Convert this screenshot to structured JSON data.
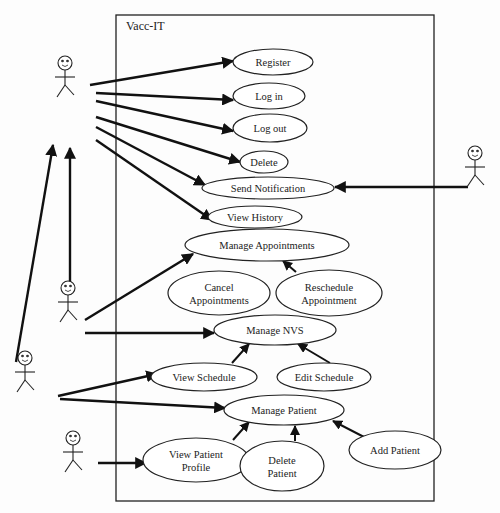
{
  "diagram": {
    "type": "uml-use-case",
    "system_boundary": {
      "title": "Vacc-IT",
      "x": 116,
      "y": 15,
      "w": 318,
      "h": 486
    },
    "actors": [
      {
        "id": "actor1",
        "x": 65,
        "y": 75
      },
      {
        "id": "actor2",
        "x": 68,
        "y": 300
      },
      {
        "id": "actor3",
        "x": 25,
        "y": 370
      },
      {
        "id": "actor4",
        "x": 73,
        "y": 450
      },
      {
        "id": "actor5",
        "x": 475,
        "y": 165
      }
    ],
    "use_cases": [
      {
        "id": "register",
        "label": [
          "Register"
        ],
        "cx": 273,
        "cy": 62,
        "rx": 40,
        "ry": 13
      },
      {
        "id": "login",
        "label": [
          "Log in"
        ],
        "cx": 269,
        "cy": 96,
        "rx": 36,
        "ry": 13
      },
      {
        "id": "logout",
        "label": [
          "Log out"
        ],
        "cx": 270,
        "cy": 128,
        "rx": 37,
        "ry": 14
      },
      {
        "id": "delete",
        "label": [
          "Delete"
        ],
        "cx": 264,
        "cy": 162,
        "rx": 24,
        "ry": 11
      },
      {
        "id": "send_notification",
        "label": [
          "Send Notification"
        ],
        "cx": 268,
        "cy": 188,
        "rx": 66,
        "ry": 11
      },
      {
        "id": "view_history",
        "label": [
          "View History"
        ],
        "cx": 255,
        "cy": 217,
        "rx": 47,
        "ry": 11
      },
      {
        "id": "manage_appointments",
        "label": [
          "Manage Appointments"
        ],
        "cx": 267,
        "cy": 245,
        "rx": 82,
        "ry": 16
      },
      {
        "id": "cancel_appointments",
        "label": [
          "Cancel",
          "Appointments"
        ],
        "cx": 219,
        "cy": 293,
        "rx": 51,
        "ry": 22
      },
      {
        "id": "reschedule_appointment",
        "label": [
          "Reschedule",
          "Appointment"
        ],
        "cx": 329,
        "cy": 293,
        "rx": 53,
        "ry": 23
      },
      {
        "id": "manage_nvs",
        "label": [
          "Manage NVS"
        ],
        "cx": 275,
        "cy": 330,
        "rx": 61,
        "ry": 15
      },
      {
        "id": "view_schedule",
        "label": [
          "View Schedule"
        ],
        "cx": 204,
        "cy": 377,
        "rx": 53,
        "ry": 14
      },
      {
        "id": "edit_schedule",
        "label": [
          "Edit Schedule"
        ],
        "cx": 324,
        "cy": 377,
        "rx": 47,
        "ry": 14
      },
      {
        "id": "manage_patient",
        "label": [
          "Manage Patient"
        ],
        "cx": 284,
        "cy": 410,
        "rx": 60,
        "ry": 15
      },
      {
        "id": "view_patient_profile",
        "label": [
          "View   Patient",
          "Profile"
        ],
        "cx": 196,
        "cy": 460,
        "rx": 53,
        "ry": 22
      },
      {
        "id": "delete_patient",
        "label": [
          "Delete",
          "Patient"
        ],
        "cx": 282,
        "cy": 466,
        "rx": 42,
        "ry": 25
      },
      {
        "id": "add_patient",
        "label": [
          "Add Patient"
        ],
        "cx": 395,
        "cy": 450,
        "rx": 46,
        "ry": 19
      }
    ],
    "associations": [
      {
        "x1": 90,
        "y1": 85,
        "x2": 233,
        "y2": 61
      },
      {
        "x1": 96,
        "y1": 93,
        "x2": 233,
        "y2": 100
      },
      {
        "x1": 96,
        "y1": 101,
        "x2": 233,
        "y2": 131
      },
      {
        "x1": 96,
        "y1": 117,
        "x2": 240,
        "y2": 162
      },
      {
        "x1": 96,
        "y1": 127,
        "x2": 205,
        "y2": 185
      },
      {
        "x1": 96,
        "y1": 140,
        "x2": 212,
        "y2": 220
      },
      {
        "x1": 85,
        "y1": 320,
        "x2": 193,
        "y2": 254
      },
      {
        "x1": 85,
        "y1": 333,
        "x2": 214,
        "y2": 333
      },
      {
        "x1": 58,
        "y1": 396,
        "x2": 157,
        "y2": 374
      },
      {
        "x1": 60,
        "y1": 399,
        "x2": 225,
        "y2": 408
      },
      {
        "x1": 98,
        "y1": 463,
        "x2": 146,
        "y2": 463
      },
      {
        "x1": 468,
        "y1": 187,
        "x2": 335,
        "y2": 187
      },
      {
        "x1": 70,
        "y1": 295,
        "x2": 70,
        "y2": 148
      },
      {
        "x1": 16,
        "y1": 362,
        "x2": 53,
        "y2": 145
      }
    ],
    "includes": [
      {
        "x1": 296,
        "y1": 272,
        "x2": 283,
        "y2": 261
      },
      {
        "x1": 232,
        "y1": 363,
        "x2": 249,
        "y2": 344
      },
      {
        "x1": 330,
        "y1": 363,
        "x2": 298,
        "y2": 344
      },
      {
        "x1": 233,
        "y1": 440,
        "x2": 249,
        "y2": 422
      },
      {
        "x1": 295,
        "y1": 441,
        "x2": 295,
        "y2": 426
      },
      {
        "x1": 364,
        "y1": 437,
        "x2": 333,
        "y2": 421
      }
    ],
    "colors": {
      "stroke": "#222222",
      "background": "#fdfdfd",
      "ellipse_fill": "#ffffff"
    }
  }
}
